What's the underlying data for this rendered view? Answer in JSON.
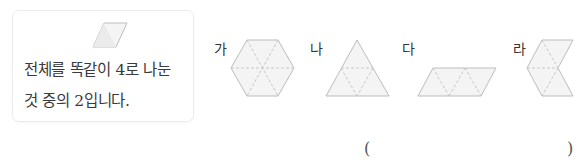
{
  "hint": {
    "line1": "전체를 똑같이 4로 나눈",
    "line2": "것 중의 2입니다."
  },
  "options": [
    {
      "label": "가",
      "shape": "hexagon-6-triangles"
    },
    {
      "label": "나",
      "shape": "triangle-4-triangles"
    },
    {
      "label": "다",
      "shape": "parallelogram-4-triangles"
    },
    {
      "label": "라",
      "shape": "chevron-4-triangles"
    }
  ],
  "answer": {
    "open": "(",
    "close": ")",
    "value": ""
  },
  "colors": {
    "stroke": "#bdbdbd",
    "fill": "#f4f4f4",
    "dash": "#c8c8c8"
  }
}
